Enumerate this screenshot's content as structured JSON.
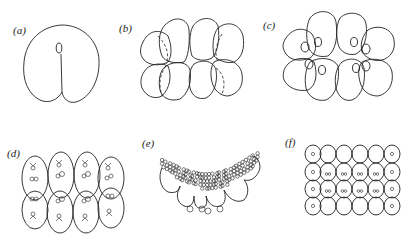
{
  "figure": {
    "panels": [
      {
        "id": "a",
        "label": "(a)",
        "description": "zygote with first cleavage furrow"
      },
      {
        "id": "b",
        "label": "(b)",
        "description": "8-cell stage"
      },
      {
        "id": "c",
        "label": "(c)",
        "description": "8-cell stage with nuclei"
      },
      {
        "id": "d",
        "label": "(d)",
        "description": "8-cell stage with dividing nuclei"
      },
      {
        "id": "e",
        "label": "(e)",
        "description": "cap of small cells over large cells"
      },
      {
        "id": "f",
        "label": "(f)",
        "description": "multicellular grid stage"
      }
    ]
  }
}
